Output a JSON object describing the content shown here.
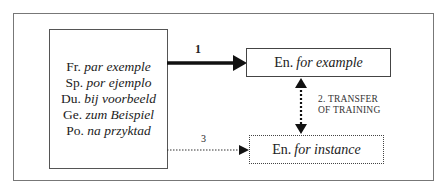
{
  "source_box": {
    "rows": [
      {
        "lang": "Fr.",
        "phrase": "par exemple"
      },
      {
        "lang": "Sp.",
        "phrase": "por ejemplo"
      },
      {
        "lang": "Du.",
        "phrase": "bij voorbeeld"
      },
      {
        "lang": "Ge.",
        "phrase": "zum Beispiel"
      },
      {
        "lang": "Po.",
        "phrase": "na przyktad"
      }
    ]
  },
  "target_boxes": {
    "example": {
      "lang": "En.",
      "phrase": "for example"
    },
    "instance": {
      "lang": "En.",
      "phrase": "for instance"
    }
  },
  "arrows": {
    "arrow1_label": "1",
    "arrow2_label_line1": "2. TRANSFER",
    "arrow2_label_line2": "OF TRAINING",
    "arrow3_label": "3"
  },
  "colors": {
    "line": "#111111",
    "frame": "#777777"
  }
}
